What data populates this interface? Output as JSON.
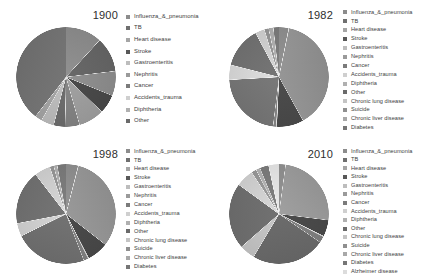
{
  "figure": {
    "title": "",
    "background": "#ffffff",
    "panel_count": 4
  },
  "palette": {
    "slice_colors": [
      "#8c8c8c",
      "#6f6f6f",
      "#a5a5a5",
      "#585858",
      "#bdbdbd",
      "#9a9a9a",
      "#7b7b7b",
      "#cfcfcf",
      "#b0b0b0",
      "#6a6a6a",
      "#c4c4c4",
      "#8f8f8f",
      "#a8a8a8",
      "#767676",
      "#dcdcdc"
    ],
    "text_color": "#3c3c3c",
    "year_color": "#2e2e2e"
  },
  "chart_data": [
    {
      "type": "pie",
      "title": "1900",
      "xlabel": "",
      "ylabel": "",
      "legend_position": "right",
      "start_angle": 90,
      "direction": "clockwise",
      "categories": [
        "Influenza_&_pneumonia",
        "TB",
        "Heart disease",
        "Stroke",
        "Gastroenteritis",
        "Nephritis",
        "Cancer",
        "Accidents_trauma",
        "Diphtheria",
        "Other"
      ],
      "values": [
        11.8,
        11.3,
        8.0,
        6.2,
        8.3,
        4.7,
        3.7,
        4.2,
        2.3,
        39.5
      ]
    },
    {
      "type": "pie",
      "title": "1982",
      "xlabel": "",
      "ylabel": "",
      "legend_position": "right",
      "start_angle": 90,
      "direction": "clockwise",
      "categories": [
        "Influenza_&_pneumonia",
        "TB",
        "Heart disease",
        "Stroke",
        "Gastroenteritis",
        "Nephritis",
        "Cancer",
        "Accidents_trauma",
        "Diphtheria",
        "Other",
        "Chronic lung disease",
        "Suicide",
        "Chronic liver disease",
        "Diabetes"
      ],
      "values": [
        3.1,
        0.1,
        38.3,
        8.6,
        0.2,
        1.0,
        21.9,
        4.8,
        0.0,
        13.1,
        3.0,
        1.4,
        1.5,
        1.8
      ]
    },
    {
      "type": "pie",
      "title": "1998",
      "xlabel": "",
      "ylabel": "",
      "legend_position": "right",
      "start_angle": 90,
      "direction": "clockwise",
      "categories": [
        "Influenza_&_pneumonia",
        "TB",
        "Heart disease",
        "Stroke",
        "Gastroenteritis",
        "Nephritis",
        "Cancer",
        "Accidents_trauma",
        "Diphtheria",
        "Other",
        "Chronic lung disease",
        "Suicide",
        "Chronic liver disease",
        "Diabetes"
      ],
      "values": [
        3.9,
        0.1,
        31.0,
        6.8,
        0.2,
        1.5,
        23.2,
        4.2,
        0.0,
        17.3,
        5.1,
        1.3,
        1.1,
        2.8
      ]
    },
    {
      "type": "pie",
      "title": "2010",
      "xlabel": "",
      "ylabel": "",
      "legend_position": "right",
      "start_angle": 90,
      "direction": "clockwise",
      "categories": [
        "Influenza_&_pneumonia",
        "TB",
        "Heart disease",
        "Stroke",
        "Gastroenteritis",
        "Nephritis",
        "Cancer",
        "Accidents_trauma",
        "Diphtheria",
        "Other",
        "Chronic lung disease",
        "Suicide",
        "Chronic liver disease",
        "Diabetes",
        "Alzheimer disease"
      ],
      "values": [
        2.1,
        0.0,
        24.2,
        5.2,
        0.2,
        2.0,
        23.3,
        4.9,
        0.0,
        20.9,
        5.6,
        1.6,
        1.3,
        2.8,
        3.3
      ]
    }
  ]
}
